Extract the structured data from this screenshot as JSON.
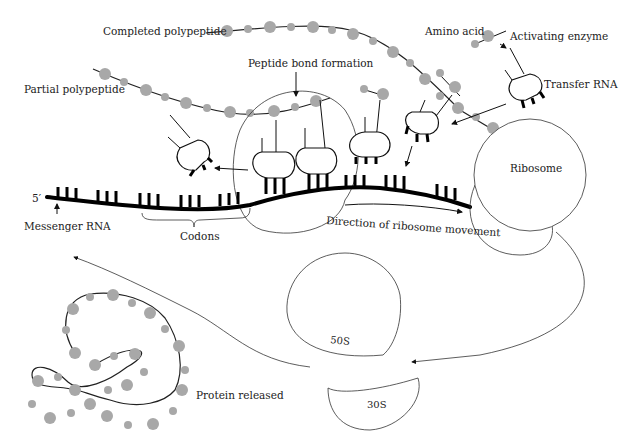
{
  "diagram": {
    "labels": {
      "completed_polypeptide": "Completed polypeptide",
      "partial_polypeptide": "Partial polypeptide",
      "peptide_bond_formation": "Peptide bond formation",
      "amino_acid": "Amino acid",
      "activating_enzyme": "Activating enzyme",
      "transfer_rna": "Transfer RNA",
      "ribosome": "Ribosome",
      "five_prime": "5′",
      "messenger_rna": "Messenger RNA",
      "codons": "Codons",
      "direction": "Direction of ribosome movement",
      "subunit_large": "50S",
      "subunit_small": "30S",
      "protein_released": "Protein released"
    },
    "colors": {
      "bead": "#a8a8a8",
      "line": "#111111",
      "background": "#ffffff"
    }
  }
}
